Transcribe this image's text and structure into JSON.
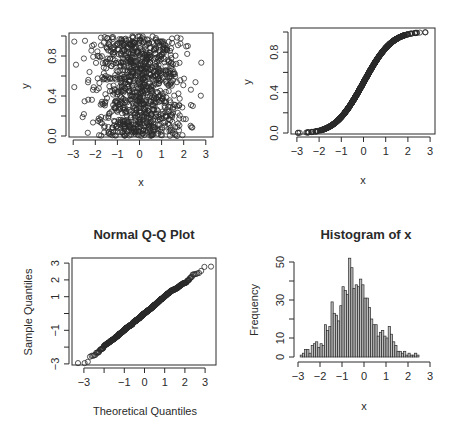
{
  "chart_data": [
    {
      "id": "scatter_x_y",
      "type": "scatter",
      "title": "",
      "xlabel": "x",
      "ylabel": "y",
      "xlim": [
        -3.1,
        3.2
      ],
      "ylim": [
        -0.03,
        1.03
      ],
      "x_ticks": [
        "-3",
        "-2",
        "-1",
        "0",
        "1",
        "2",
        "3"
      ],
      "y_ticks": [
        "0.0",
        "0.4",
        "0.8"
      ],
      "y_minor_ticks": [
        0.0,
        0.2,
        0.4,
        0.6,
        0.8,
        1.0
      ],
      "n_points": 1000,
      "description": "x ~ Normal(0,1), y ~ Uniform(0,1); open circles"
    },
    {
      "id": "scatter_x_pnorm",
      "type": "scatter",
      "title": "",
      "xlabel": "x",
      "ylabel": "y",
      "xlim": [
        -3.1,
        3.2
      ],
      "ylim": [
        -0.03,
        1.03
      ],
      "x_ticks": [
        "-3",
        "-2",
        "-1",
        "0",
        "1",
        "2",
        "3"
      ],
      "y_ticks": [
        "0.0",
        "0.4",
        "0.8"
      ],
      "y_minor_ticks": [
        0.0,
        0.2,
        0.4,
        0.6,
        0.8,
        1.0
      ],
      "n_points": 1000,
      "description": "y = pnorm(x), normal CDF S-curve; open circles"
    },
    {
      "id": "qqnorm",
      "type": "scatter",
      "title": "Normal Q-Q Plot",
      "xlabel": "Theoretical Quantiles",
      "ylabel": "Sample Quantiles",
      "xlim": [
        -3.3,
        3.4
      ],
      "ylim": [
        -3.05,
        3.3
      ],
      "x_ticks": [
        "-3",
        "",
        "-1",
        "0",
        "1",
        "2",
        "3"
      ],
      "x_tick_values": [
        -3,
        -2,
        -1,
        0,
        1,
        2,
        3
      ],
      "y_ticks": [
        "-3",
        "",
        "-1",
        "",
        "1",
        "2",
        "3"
      ],
      "y_tick_values": [
        -3,
        -2,
        -1,
        0,
        1,
        2,
        3
      ],
      "n_points": 1000,
      "description": "Sample quantiles vs theoretical normal quantiles; near-straight line"
    },
    {
      "id": "histogram_x",
      "type": "bar",
      "title": "Histogram of x",
      "xlabel": "x",
      "ylabel": "Frequency",
      "xlim": [
        -3.1,
        3.1
      ],
      "ylim": [
        0,
        52
      ],
      "x_ticks": [
        "-3",
        "-2",
        "-1",
        "0",
        "1",
        "2",
        "3"
      ],
      "y_ticks": [
        "0",
        "10",
        "30",
        "50"
      ],
      "y_tick_values": [
        0,
        10,
        20,
        30,
        40,
        50
      ],
      "bin_start": -2.9,
      "bin_width": 0.1,
      "values": [
        1,
        2,
        4,
        4,
        2,
        6,
        7,
        8,
        5,
        7,
        6,
        17,
        14,
        16,
        29,
        23,
        22,
        19,
        27,
        37,
        35,
        33,
        52,
        47,
        36,
        38,
        37,
        41,
        38,
        31,
        31,
        26,
        20,
        17,
        17,
        11,
        13,
        14,
        11,
        10,
        16,
        12,
        8,
        6,
        3,
        3,
        2,
        3,
        1,
        2,
        1,
        1,
        2,
        1
      ]
    }
  ],
  "panels": {
    "top_left": {
      "xlabel": "x",
      "ylabel": "y"
    },
    "top_right": {
      "xlabel": "x",
      "ylabel": "y"
    },
    "bottom_left": {
      "title": "Normal Q-Q Plot",
      "xlabel": "Theoretical Quantiles",
      "ylabel": "Sample Quantiles"
    },
    "bottom_right": {
      "title": "Histogram of x",
      "xlabel": "x",
      "ylabel": "Frequency"
    }
  },
  "colors": {
    "ink": "#2a2a2a",
    "bar_fill": "#bdbdbd",
    "background": "#ffffff"
  }
}
